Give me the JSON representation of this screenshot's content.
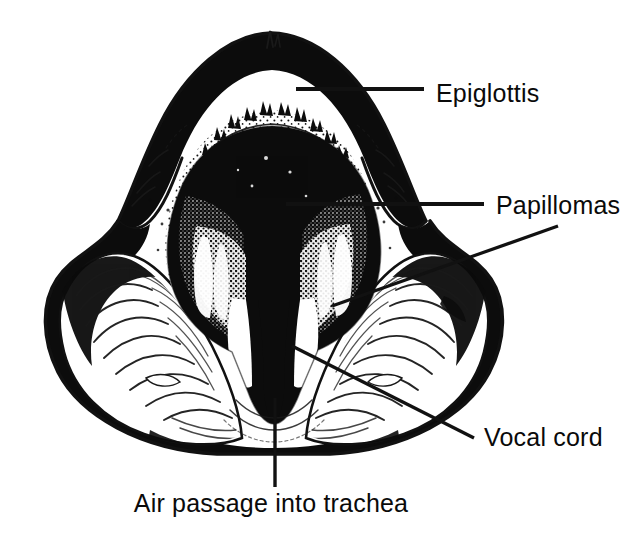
{
  "figure": {
    "background_color": "#ffffff",
    "ink_color": "#0c0c0c",
    "line_color": "#111111",
    "labels": [
      {
        "id": "epiglottis",
        "text": "Epiglottis",
        "text_x": 436,
        "text_y": 102,
        "leader": "M 296 89 L 424 89"
      },
      {
        "id": "papillomas",
        "text": "Papillomas",
        "text_x": 496,
        "text_y": 214,
        "leader": "M 286 204 L 484 204"
      },
      {
        "id": "vocal-cord",
        "text": "Vocal cord",
        "text_x": 484,
        "text_y": 446,
        "leader": "M 292 346 L 474 438"
      },
      {
        "id": "air-passage",
        "text": "Air passage into trachea",
        "text_x": 271,
        "text_y": 512,
        "leader": "M 275 398 L 275 487"
      },
      {
        "id": "papilloma-second-leader",
        "text": "",
        "text_x": 0,
        "text_y": 0,
        "leader": "M 332 306 L 558 226"
      }
    ],
    "regions": [
      {
        "id": "epiglottis-flap",
        "description": "large pale arched epiglottis flap across the top"
      },
      {
        "id": "airway-void",
        "description": "dark central glottic airway opening"
      },
      {
        "id": "papilloma-mass",
        "description": "stippled warty papilloma growths lining the laryngeal inlet"
      },
      {
        "id": "vocal-cord-left",
        "description": "left vocal cord, pale band beside the airway"
      },
      {
        "id": "vocal-cord-right",
        "description": "right vocal cord, pale band beside the airway"
      },
      {
        "id": "ary-epiglottic-fold-left",
        "description": "left aryepiglottic fold bulging laterally"
      },
      {
        "id": "ary-epiglottic-fold-right",
        "description": "right aryepiglottic fold bulging laterally"
      },
      {
        "id": "trachea-opening",
        "description": "lower dark slit continuing into the trachea"
      }
    ]
  }
}
